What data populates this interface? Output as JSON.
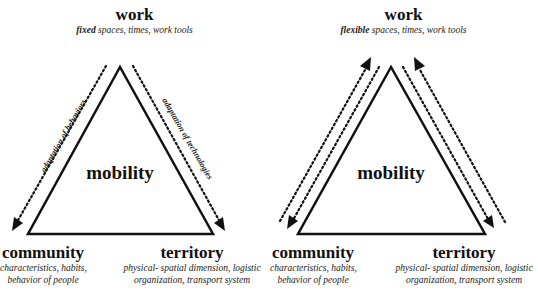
{
  "panels": [
    {
      "id": "fixed",
      "work": {
        "title": "work",
        "qualifier": "fixed",
        "description": " spaces, times, work tools"
      },
      "center": "mobility",
      "community": {
        "title": "community",
        "line1": "characteristics, habits,",
        "line2": "behavior of people"
      },
      "territory": {
        "title": "territory",
        "line1": "physical- spatial dimension, logistic",
        "line2": "organization, transport system"
      },
      "edges": {
        "left": "adaptation of behaviors",
        "right": "adaptation of technologies"
      },
      "arrow_direction": "outward-down"
    },
    {
      "id": "flexible",
      "work": {
        "title": "work",
        "qualifier": "flexible",
        "description": " spaces, times, work tools"
      },
      "center": "mobility",
      "community": {
        "title": "community",
        "line1": "characteristics, habits,",
        "line2": "behavior of people"
      },
      "territory": {
        "title": "territory",
        "line1": "physical- spatial dimension, logistic",
        "line2": "organization, transport system"
      },
      "arrow_direction": "bidirectional"
    }
  ],
  "colors": {
    "stroke": "#111111",
    "background": "#ffffff"
  }
}
